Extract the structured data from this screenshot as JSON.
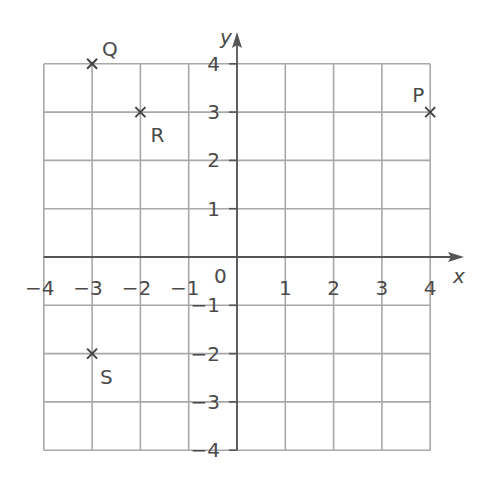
{
  "chart_data": {
    "type": "scatter",
    "title": "",
    "xlabel": "x",
    "ylabel": "y",
    "xlim": [
      -4,
      4
    ],
    "ylim": [
      -4,
      4
    ],
    "grid": true,
    "x_ticks": [
      "-4",
      "-3",
      "-2",
      "-1",
      "1",
      "2",
      "3",
      "4"
    ],
    "y_ticks": [
      "4",
      "3",
      "2",
      "1",
      "-1",
      "-2",
      "-3",
      "-4"
    ],
    "origin_label": "0",
    "marker": "x",
    "points": [
      {
        "label": "P",
        "x": 4,
        "y": 3
      },
      {
        "label": "Q",
        "x": -3,
        "y": 4
      },
      {
        "label": "R",
        "x": -2,
        "y": 3
      },
      {
        "label": "S",
        "x": -3,
        "y": -2
      }
    ]
  },
  "colors": {
    "grid": "#a8a8a8",
    "axis": "#555555",
    "text": "#4a4a4a",
    "marker": "#444444"
  }
}
